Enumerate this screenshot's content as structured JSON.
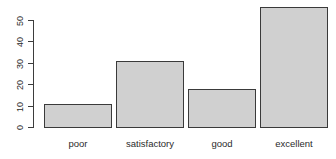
{
  "chart_data": {
    "type": "bar",
    "title": "",
    "subtitle": "",
    "xlabel": "",
    "ylabel": "",
    "categories": [
      "poor",
      "satisfactory",
      "good",
      "excellent"
    ],
    "values": [
      11,
      31,
      18,
      56
    ],
    "series": [
      {
        "name": "frequency",
        "values": [
          11,
          31,
          18,
          56
        ]
      }
    ],
    "ylim": [
      0,
      50
    ],
    "y_ticks": [
      0,
      10,
      20,
      30,
      40,
      50
    ],
    "y_tick_labels": [
      "0",
      "10",
      "20",
      "30",
      "40",
      "50"
    ],
    "grid": false,
    "legend": false,
    "legend_position": "none",
    "bar_fill_color": "#d0d0d0",
    "bar_border_color": "#3a3a3a",
    "axis_color": "#3d3d3d",
    "text_color": "#2b2b2b",
    "background_color": "#ffffff",
    "y_axis_label_rotation": "vertical"
  },
  "axis": {
    "y_labels": [
      {
        "text": "50",
        "value": 50
      },
      {
        "text": "40",
        "value": 40
      },
      {
        "text": "30",
        "value": 30
      },
      {
        "text": "20",
        "value": 20
      },
      {
        "text": "10",
        "value": 10
      },
      {
        "text": "0",
        "value": 0
      }
    ]
  },
  "bars": [
    {
      "label": "poor",
      "value": 11
    },
    {
      "label": "satisfactory",
      "value": 31
    },
    {
      "label": "good",
      "value": 18
    },
    {
      "label": "excellent",
      "value": 56
    }
  ]
}
